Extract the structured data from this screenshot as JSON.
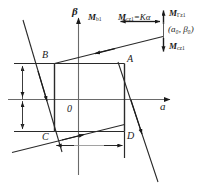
{
  "figure": {
    "axes": {
      "x_label": "a",
      "y_label": "β",
      "origin_label": "0"
    },
    "points": [
      {
        "id": "A",
        "label": "A"
      },
      {
        "id": "B",
        "label": "B"
      },
      {
        "id": "C",
        "label": "C"
      },
      {
        "id": "D",
        "label": "D"
      }
    ],
    "annotations": {
      "m_b1": {
        "base": "M",
        "sub": "b1"
      },
      "m_cz1_eq": {
        "base": "M",
        "sub": "cz1",
        "equals": "=K",
        "symbol": "α"
      },
      "m_z1_top": {
        "base": "M",
        "sub": "Γz1"
      },
      "coord_point": "(a₀, β₀)",
      "m_cz1_bottom": {
        "base": "M",
        "sub": "cz1"
      }
    },
    "colors": {
      "line": "#1a1a1a",
      "axis": "#5a5a5a",
      "dimension": "#7a7a7a",
      "background": "#ffffff"
    }
  }
}
